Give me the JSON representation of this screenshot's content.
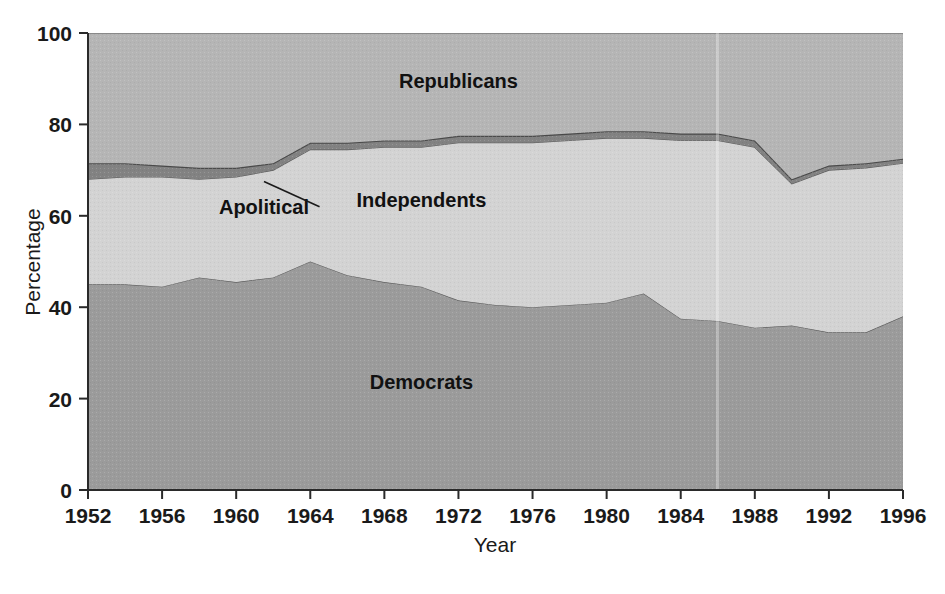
{
  "chart_data": {
    "type": "area",
    "stacked": true,
    "title": "",
    "xlabel": "Year",
    "ylabel": "Percentage",
    "xlim": [
      1952,
      1996
    ],
    "ylim": [
      0,
      100
    ],
    "grid": false,
    "legend": "inline-labels",
    "xticks": [
      1952,
      1956,
      1960,
      1964,
      1968,
      1972,
      1976,
      1980,
      1984,
      1988,
      1992,
      1996
    ],
    "yticks": [
      0,
      20,
      40,
      60,
      80,
      100
    ],
    "xtick_labels": [
      "1952",
      "1956",
      "1960",
      "1964",
      "1968",
      "1972",
      "1976",
      "1980",
      "1984",
      "1988",
      "1992",
      "1996"
    ],
    "ytick_labels": [
      "0",
      "20",
      "40",
      "60",
      "80",
      "100"
    ],
    "x": [
      1952,
      1954,
      1956,
      1958,
      1960,
      1962,
      1964,
      1966,
      1968,
      1970,
      1972,
      1974,
      1976,
      1978,
      1980,
      1982,
      1984,
      1986,
      1988,
      1990,
      1992,
      1994,
      1996
    ],
    "series": [
      {
        "name": "Democrats",
        "color": "#9b9b9b",
        "values": [
          45,
          45,
          44.5,
          46.5,
          45.5,
          46.5,
          50,
          47,
          45.5,
          44.5,
          41.5,
          40.5,
          40,
          40.5,
          41,
          43,
          37.5,
          37,
          35.5,
          36,
          34.5,
          34.5,
          38
        ]
      },
      {
        "name": "Independents",
        "color": "#d3d3d3",
        "values": [
          23,
          23.5,
          24,
          21.5,
          23,
          23.5,
          24.5,
          27.5,
          29.5,
          30.5,
          34.5,
          35.5,
          36,
          36,
          36,
          34,
          39,
          39.5,
          39.5,
          31,
          35.5,
          36,
          33.5
        ]
      },
      {
        "name": "Apolitical",
        "color": "#828282",
        "values": [
          3.5,
          3,
          2.5,
          2.5,
          2,
          1.5,
          1.5,
          1.5,
          1.5,
          1.5,
          1.5,
          1.5,
          1.5,
          1.5,
          1.5,
          1.5,
          1.5,
          1.5,
          1.5,
          1,
          1,
          1,
          1
        ]
      },
      {
        "name": "Republicans",
        "color": "#b5b5b5",
        "values": [
          28.5,
          28.5,
          29,
          29.5,
          29.5,
          28.5,
          24,
          24,
          23.5,
          23.5,
          22.5,
          22.5,
          22.5,
          22,
          21.5,
          21.5,
          22,
          22,
          23.5,
          32,
          29,
          28.5,
          27.5
        ]
      }
    ],
    "inline_labels": [
      {
        "text": "Republicans",
        "x": 1972,
        "y": 88
      },
      {
        "text": "Independents",
        "x": 1970,
        "y": 62
      },
      {
        "text": "Democrats",
        "x": 1970,
        "y": 22
      },
      {
        "text": "Apolitical",
        "x": 1961.5,
        "y": 60.5
      }
    ],
    "annotation": {
      "label": "Apolitical",
      "leader_from_x": 1964.5,
      "leader_from_y": 62,
      "leader_to_x": 1961.5,
      "leader_to_y": 67.5
    },
    "colors": {
      "democrats": "#9b9b9b",
      "independents": "#d3d3d3",
      "apolitical": "#828282",
      "republicans": "#b5b5b5",
      "axis": "#2a2a2a",
      "text": "#1a1a1a"
    }
  },
  "axes": {
    "y_title": "Percentage",
    "x_title": "Year"
  }
}
